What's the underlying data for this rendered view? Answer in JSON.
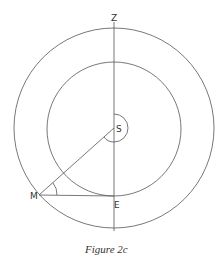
{
  "figure": {
    "caption": "Figure 2c",
    "labels": {
      "zenith": "Z",
      "sun": "S",
      "moon": "M",
      "earth": "E"
    },
    "geometry": {
      "center": [
        114,
        128
      ],
      "outer_radius": 100,
      "inner_radius": 67,
      "vertical_line": {
        "x": 114,
        "y1": 22,
        "y2": 231
      },
      "point_S": [
        114,
        128
      ],
      "point_M": [
        39,
        195
      ],
      "point_E": [
        114,
        196
      ]
    },
    "colors": {
      "stroke": "#555555",
      "text": "#333333",
      "background": "#ffffff"
    }
  }
}
